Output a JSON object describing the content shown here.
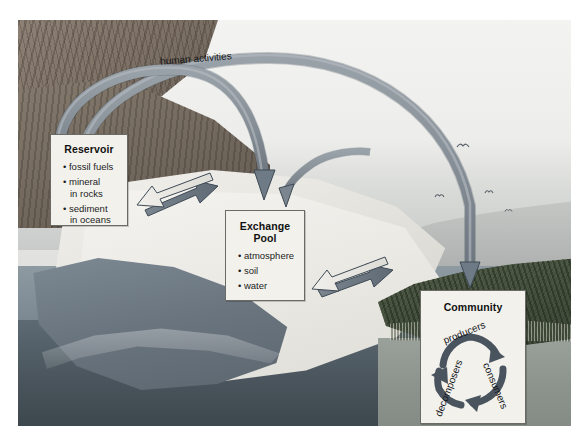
{
  "diagram": {
    "flow_label": "human activities",
    "boxes": {
      "reservoir": {
        "title": "Reservoir",
        "items": [
          {
            "text": "fossil fuels",
            "cont": ""
          },
          {
            "text": "mineral",
            "cont": "in rocks"
          },
          {
            "text": "sediment",
            "cont": "in oceans"
          }
        ]
      },
      "exchange": {
        "title_line1": "Exchange",
        "title_line2": "Pool",
        "items": [
          {
            "text": "atmosphere",
            "cont": ""
          },
          {
            "text": "soil",
            "cont": ""
          },
          {
            "text": "water",
            "cont": ""
          }
        ]
      },
      "community": {
        "title": "Community",
        "cycle": {
          "producers": "producers",
          "consumers": "consumers",
          "decomposers": "decomposers"
        }
      }
    },
    "arrows": [
      {
        "name": "reservoir-exchange-exchange-to-reservoir",
        "direction": "left"
      },
      {
        "name": "reservoir-exchange-reservoir-to-exchange",
        "direction": "right"
      },
      {
        "name": "exchange-community-community-to-exchange",
        "direction": "left"
      },
      {
        "name": "exchange-community-exchange-to-community",
        "direction": "right"
      },
      {
        "name": "human-activities-to-exchange-pool",
        "direction": "arc-down"
      },
      {
        "name": "human-activities-to-community",
        "direction": "arc-down"
      },
      {
        "name": "human-activities-short-arc",
        "direction": "arc-down"
      }
    ],
    "scene": {
      "elements": [
        "rocky-cliff",
        "sandy-beach",
        "ocean-water",
        "submerged-sediment",
        "vegetated-shore",
        "birds"
      ],
      "bird_glyph": "ᵛ"
    },
    "colors": {
      "arrow_fill": "#6e7a85",
      "arrow_stroke": "#3e4a55",
      "arc_fill": "#8b949c",
      "arc_stroke": "#4e5860",
      "box_bg": "#f2f1ec",
      "box_border": "#6b6b66",
      "text": "#15161a",
      "sky": "#eeeeec",
      "water": "#616f79",
      "vegetation": "#47513f"
    }
  }
}
